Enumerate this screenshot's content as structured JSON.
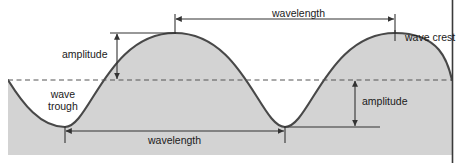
{
  "figure": {
    "labels": {
      "amplitude_left": "amplitude",
      "amplitude_right": "amplitude",
      "wavelength_top": "wavelength",
      "wavelength_bottom": "wavelength",
      "wave_crest": "wave crest",
      "wave_trough_line1": "wave",
      "wave_trough_line2": "trough"
    },
    "colors": {
      "page_background": "#ffffff",
      "panel_background": "#ffffff",
      "water_fill": "#d2d2d2",
      "curve_stroke": "#404040",
      "midline_dash": "#555555",
      "dimension_line": "#333333",
      "right_border": "#3a3a3a",
      "text": "#1a1a1a"
    },
    "geometry": {
      "panel": {
        "x": 8,
        "y": 14,
        "width": 444,
        "height": 141
      },
      "midline_y": 80,
      "crest_y": 33,
      "trough_y": 127,
      "amplitude_px": 47,
      "wavelength_px": 220,
      "crest_x": [
        175,
        395
      ],
      "trough_x": [
        65,
        285
      ],
      "amplitude_left_arrow_x": 117,
      "amplitude_right_arrow_x": 355,
      "wavelength_top_span": [
        175,
        395
      ],
      "wavelength_top_y": 18,
      "wavelength_bottom_span": [
        65,
        285
      ],
      "wavelength_bottom_y": 131
    }
  }
}
